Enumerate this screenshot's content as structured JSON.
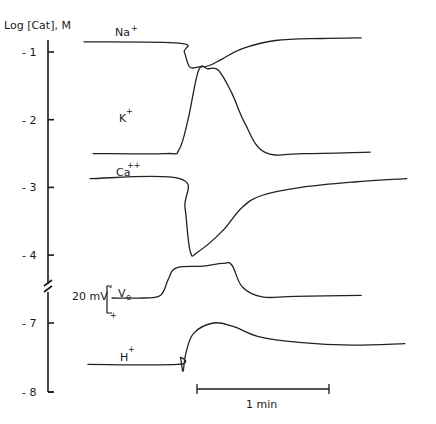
{
  "chart_data": {
    "type": "line",
    "title": "",
    "ylabel": "Log [Cat], M",
    "xlabel": "",
    "y_ticks": [
      {
        "value": -1,
        "label": "- 1"
      },
      {
        "value": -2,
        "label": "- 2"
      },
      {
        "value": -3,
        "label": "- 3"
      },
      {
        "value": -4,
        "label": "- 4"
      },
      {
        "value": -7,
        "label": "- 7"
      },
      {
        "value": -8,
        "label": "- 8"
      }
    ],
    "axis_break": {
      "between": [
        -4,
        -7
      ]
    },
    "ylim": [
      -8,
      -0.8
    ],
    "grid": false,
    "time_unit": "min",
    "scale_bar": {
      "label": "1 min",
      "duration_min": 1
    },
    "voltage_scale": {
      "label": "20 mV",
      "top_sign": "-",
      "bottom_sign": "+"
    },
    "series": [
      {
        "name": "Na+",
        "label": "Na",
        "charge": "+",
        "t_min": [
          0,
          0.72,
          0.76,
          0.8,
          0.87,
          0.95,
          1.05,
          1.2,
          1.45,
          1.8,
          2.1
        ],
        "values": [
          -0.85,
          -0.87,
          -1.0,
          -1.22,
          -1.22,
          -1.2,
          -1.1,
          -0.95,
          -0.83,
          -0.8,
          -0.79
        ]
      },
      {
        "name": "K+",
        "label": "K",
        "charge": "+",
        "t_min": [
          0,
          0.55,
          0.65,
          0.72,
          0.8,
          0.87,
          0.95,
          1.05,
          1.15,
          1.3,
          1.6,
          2.1
        ],
        "values": [
          -2.5,
          -2.5,
          -2.45,
          -2.0,
          -1.27,
          -1.25,
          -1.27,
          -1.6,
          -2.05,
          -2.48,
          -2.5,
          -2.48
        ]
      },
      {
        "name": "Ca++",
        "label": "Ca",
        "charge": "++",
        "t_min": [
          0,
          0.68,
          0.72,
          0.76,
          0.82,
          1.0,
          1.15,
          1.3,
          1.6,
          2.0,
          2.4
        ],
        "values": [
          -2.87,
          -2.87,
          -3.3,
          -3.95,
          -3.95,
          -3.65,
          -3.3,
          -3.12,
          -3.0,
          -2.92,
          -2.87
        ]
      },
      {
        "name": "Ve",
        "label": "V",
        "subscript": "e",
        "t_min": [
          0,
          0.45,
          0.58,
          0.64,
          0.7,
          0.9,
          1.05,
          1.12,
          1.2,
          1.35,
          1.6,
          2.1
        ],
        "values": [
          0,
          0,
          0.05,
          0.35,
          0.55,
          0.58,
          0.63,
          0.6,
          0.2,
          0.02,
          0.03,
          0.05
        ],
        "unit": "relative (20 mV scale)"
      },
      {
        "name": "H+",
        "label": "H",
        "charge": "+",
        "t_min": [
          0,
          0.68,
          0.7,
          0.72,
          0.74,
          0.8,
          0.95,
          1.1,
          1.3,
          1.6,
          2.0,
          2.4
        ],
        "values": [
          -7.6,
          -7.6,
          -7.5,
          -7.7,
          -7.45,
          -7.15,
          -7.0,
          -7.05,
          -7.2,
          -7.28,
          -7.32,
          -7.3
        ]
      }
    ]
  }
}
